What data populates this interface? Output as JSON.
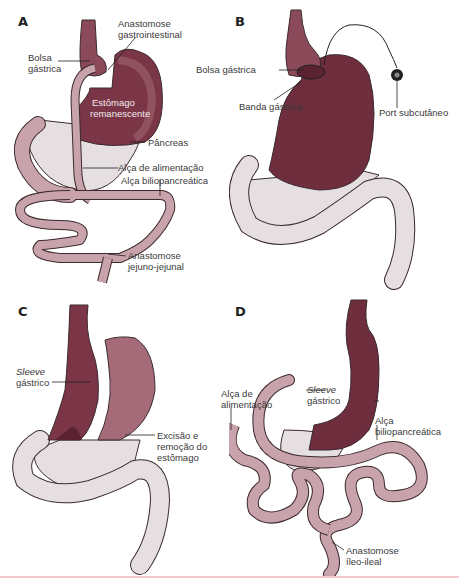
{
  "figure": {
    "colors": {
      "stomach": "#6e2e3e",
      "stomach_light": "#a56b79",
      "intestine": "#c9a3ac",
      "intestine_outline": "#3b2a2e",
      "pancreas": "#e6dfe2",
      "bottom_rule": "#f2c9cf"
    },
    "panels": [
      {
        "letter": "A",
        "labels": {
          "anastomose_gi": [
            "Anastomose",
            "gastrointestinal"
          ],
          "bolsa": [
            "Bolsa",
            "gástrica"
          ],
          "estomago_rem": [
            "Estômago",
            "remanescente"
          ],
          "pancreas": "Pâncreas",
          "alca_alim": "Alça de alimentação",
          "alca_bilio": "Alça biliopancreática",
          "anastomose_jj": [
            "Anastomose",
            "jejuno-jejunal"
          ]
        }
      },
      {
        "letter": "B",
        "labels": {
          "bolsa": "Bolsa gástrica",
          "banda": "Banda gástrica",
          "port": "Port subcutâneo"
        }
      },
      {
        "letter": "C",
        "labels": {
          "sleeve": [
            "Sleeve",
            "gástrico"
          ],
          "excisao": [
            "Excisão e",
            "remoção do",
            "estômago"
          ]
        }
      },
      {
        "letter": "D",
        "labels": {
          "alca_alim": [
            "Alça de",
            "alimentação"
          ],
          "sleeve": [
            "Sleeve",
            "gástrico"
          ],
          "alca_bilio": [
            "Alça",
            "biliopancreática"
          ],
          "anastomose_ii": [
            "Anastomose",
            "íleo-ileal"
          ]
        }
      }
    ]
  }
}
